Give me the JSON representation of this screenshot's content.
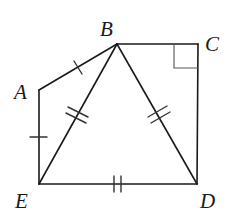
{
  "diagram": {
    "type": "geometry-figure",
    "stroke_color": "#1a1a1a",
    "points": {
      "A": {
        "label": "A",
        "x": 39,
        "y": 90,
        "label_x": 14,
        "label_y": 99
      },
      "B": {
        "label": "B",
        "x": 117,
        "y": 44,
        "label_x": 100,
        "label_y": 36
      },
      "C": {
        "label": "C",
        "x": 198,
        "y": 44,
        "label_x": 205,
        "label_y": 51
      },
      "D": {
        "label": "D",
        "x": 197,
        "y": 184,
        "label_x": 200,
        "label_y": 208
      },
      "E": {
        "label": "E",
        "x": 39,
        "y": 184,
        "label_x": 15,
        "label_y": 208
      }
    },
    "segments": [
      {
        "from": "A",
        "to": "B",
        "ticks": 1
      },
      {
        "from": "B",
        "to": "C",
        "ticks": 0
      },
      {
        "from": "C",
        "to": "D",
        "ticks": 0
      },
      {
        "from": "D",
        "to": "E",
        "ticks": 2
      },
      {
        "from": "E",
        "to": "A",
        "ticks": 1
      },
      {
        "from": "B",
        "to": "E",
        "ticks": 2
      },
      {
        "from": "B",
        "to": "D",
        "ticks": 2
      }
    ],
    "right_angle_at": "C",
    "congruence": [
      "AB = AE (single tick)",
      "BE = BD = ED (double tick)"
    ]
  }
}
